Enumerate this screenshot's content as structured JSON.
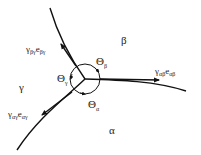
{
  "diagram": {
    "type": "triple-junction",
    "colors": {
      "stroke": "#111111",
      "text": "#222222",
      "background": "#ffffff"
    },
    "phases": [
      {
        "id": "beta",
        "label": "β"
      },
      {
        "id": "gamma",
        "label": "γ"
      },
      {
        "id": "alpha",
        "label": "α"
      }
    ],
    "angles": [
      {
        "id": "theta-beta",
        "symbol": "Θ",
        "sub": "β"
      },
      {
        "id": "theta-gamma",
        "symbol": "Θ",
        "sub": "γ"
      },
      {
        "id": "theta-alpha",
        "symbol": "Θ",
        "sub": "α"
      }
    ],
    "tension_vectors": [
      {
        "id": "beta-gamma",
        "gamma": "γ",
        "gamma_sub": "βγ",
        "e": "e",
        "e_sub": "βγ"
      },
      {
        "id": "alpha-gamma",
        "gamma": "γ",
        "gamma_sub": "αγ",
        "e": "e",
        "e_sub": "αγ"
      },
      {
        "id": "alpha-beta",
        "gamma": "γ",
        "gamma_sub": "αβ",
        "e": "e",
        "e_sub": "αβ"
      }
    ]
  }
}
